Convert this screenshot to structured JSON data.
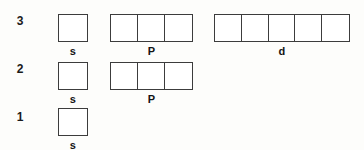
{
  "diagram": {
    "colors": {
      "border": "#3c3c3c",
      "text": "#141414",
      "box_fill": "#ffffff",
      "background": "#fdfdfb"
    },
    "rows": [
      {
        "shell_number": "3",
        "shell_y": 14,
        "label_y": 36,
        "number_x": 12,
        "number_y": 14,
        "orbitals": [
          {
            "label": "s",
            "boxes": 1,
            "x": 58,
            "width": 30
          },
          {
            "label": "P",
            "boxes": 3,
            "x": 110,
            "width": 83
          },
          {
            "label": "d",
            "boxes": 5,
            "x": 214,
            "width": 136
          }
        ]
      },
      {
        "shell_number": "2",
        "shell_y": 62,
        "label_y": 84,
        "number_x": 12,
        "number_y": 62,
        "orbitals": [
          {
            "label": "s",
            "boxes": 1,
            "x": 58,
            "width": 30
          },
          {
            "label": "P",
            "boxes": 3,
            "x": 110,
            "width": 83
          }
        ]
      },
      {
        "shell_number": "1",
        "shell_y": 108,
        "label_y": 130,
        "number_x": 12,
        "number_y": 110,
        "orbitals": [
          {
            "label": "s",
            "boxes": 1,
            "x": 58,
            "width": 30
          }
        ]
      }
    ]
  }
}
